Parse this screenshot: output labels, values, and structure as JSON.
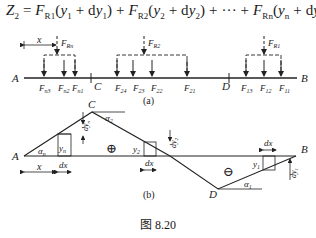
{
  "formula": {
    "lhs": "Z",
    "lhs_sub": "2",
    "eq": " = ",
    "terms": [
      {
        "F": "F",
        "sub": "R1",
        "y": "y",
        "ysub": "1",
        "dy": "dy",
        "dysub": "1"
      },
      {
        "F": "F",
        "sub": "R2",
        "y": "y",
        "ysub": "2",
        "dy": "dy",
        "dysub": "2"
      },
      {
        "F": "F",
        "sub": "Rn",
        "y": "y",
        "ysub": "n",
        "dy": "dy",
        "dysub": "n"
      }
    ],
    "ellipsis": "+ ··· +"
  },
  "fig_a": {
    "label": "(a)",
    "points": {
      "A": "A",
      "B": "B",
      "C": "C",
      "D": "D"
    },
    "x_label": "x",
    "resultants": [
      {
        "F": "F",
        "sub": "Rn"
      },
      {
        "F": "F",
        "sub": "R2"
      },
      {
        "F": "F",
        "sub": "R1"
      }
    ],
    "loads": [
      {
        "F": "F",
        "sub": "n3"
      },
      {
        "F": "F",
        "sub": "n2"
      },
      {
        "F": "F",
        "sub": "n1"
      },
      {
        "F": "F",
        "sub": "24"
      },
      {
        "F": "F",
        "sub": "23"
      },
      {
        "F": "F",
        "sub": "22"
      },
      {
        "F": "F",
        "sub": "21"
      },
      {
        "F": "F",
        "sub": "13"
      },
      {
        "F": "F",
        "sub": "12"
      },
      {
        "F": "F",
        "sub": "11"
      }
    ]
  },
  "fig_b": {
    "label": "(b)",
    "points": {
      "A": "A",
      "B": "B",
      "C": "C",
      "D": "D"
    },
    "plus": "⊕",
    "minus": "⊖",
    "x_label": "x",
    "dx": "dx",
    "angles": [
      {
        "a": "α",
        "sub": "n"
      },
      {
        "a": "α",
        "sub": "2"
      },
      {
        "a": "α",
        "sub": "1"
      }
    ],
    "ordinates": [
      {
        "y": "y",
        "sub": "n"
      },
      {
        "y": "y",
        "sub": "2"
      },
      {
        "y": "y",
        "sub": "1"
      }
    ],
    "increments": [
      {
        "dy": "dy",
        "sub": "n"
      },
      {
        "dy": "dy",
        "sub": "2"
      },
      {
        "dy": "dy",
        "sub": "1"
      }
    ]
  },
  "caption": "图 8.20"
}
